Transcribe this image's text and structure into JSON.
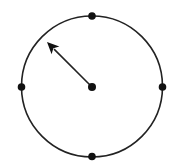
{
  "diagram": {
    "type": "circle-dial",
    "canvas": {
      "width": 172,
      "height": 168,
      "background": "#ffffff"
    },
    "circle": {
      "cx": 92,
      "cy": 86.5,
      "r": 70.5,
      "stroke": "#222222",
      "stroke_width": 1.6
    },
    "center_dot": {
      "cx": 92,
      "cy": 87,
      "r": 4,
      "fill": "#111111"
    },
    "markers": [
      {
        "name": "top",
        "cx": 92,
        "cy": 16,
        "r": 3.8
      },
      {
        "name": "right",
        "cx": 162.5,
        "cy": 87,
        "r": 3.8
      },
      {
        "name": "bottom",
        "cx": 92,
        "cy": 156.5,
        "r": 3.8
      },
      {
        "name": "left",
        "cx": 21.5,
        "cy": 87,
        "r": 3.8
      }
    ],
    "arrow": {
      "from": [
        92,
        87
      ],
      "to": [
        47,
        42
      ],
      "direction": "upper-left",
      "angle_deg": 135,
      "stroke": "#222222",
      "stroke_width": 1.6
    },
    "colors": {
      "line": "#222222",
      "dot": "#111111"
    }
  }
}
